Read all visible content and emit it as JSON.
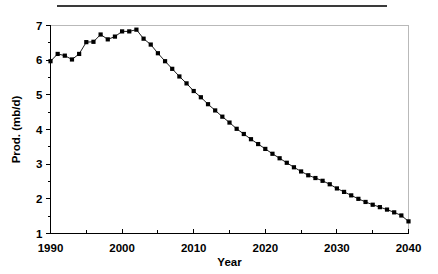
{
  "figure": {
    "top_rule_name": "scan-artifact-rule",
    "background": "#ffffff",
    "ink_color": "#000000",
    "frame_color": "#b9b9b9"
  },
  "chart_data": {
    "type": "line",
    "title": "",
    "xlabel": "Year",
    "ylabel": "Prod. (mb/d)",
    "xlim": [
      1990,
      2040
    ],
    "ylim": [
      1,
      7
    ],
    "xticks": [
      1990,
      2000,
      2010,
      2020,
      2030,
      2040
    ],
    "xtick_labels": [
      "1990",
      "2000",
      "2010",
      "2020",
      "2030",
      "2040"
    ],
    "xticks_minor": [
      1995,
      2005,
      2015,
      2025,
      2035
    ],
    "yticks": [
      1,
      2,
      3,
      4,
      5,
      6,
      7
    ],
    "ytick_labels": [
      "1",
      "2",
      "3",
      "4",
      "5",
      "6",
      "7"
    ],
    "yticks_minor": [
      1.5,
      2.5,
      3.5,
      4.5,
      5.5,
      6.5
    ],
    "grid": false,
    "legend": false,
    "marker": "square",
    "series": [
      {
        "name": "Production",
        "x": [
          1990,
          1991,
          1992,
          1993,
          1994,
          1995,
          1996,
          1997,
          1998,
          1999,
          2000,
          2001,
          2002,
          2003,
          2004,
          2005,
          2006,
          2007,
          2008,
          2009,
          2010,
          2011,
          2012,
          2013,
          2014,
          2015,
          2016,
          2017,
          2018,
          2019,
          2020,
          2021,
          2022,
          2023,
          2024,
          2025,
          2026,
          2027,
          2028,
          2029,
          2030,
          2031,
          2032,
          2033,
          2034,
          2035,
          2036,
          2037,
          2038,
          2039,
          2040
        ],
        "values": [
          5.97,
          6.18,
          6.13,
          6.02,
          6.18,
          6.52,
          6.53,
          6.74,
          6.6,
          6.68,
          6.83,
          6.83,
          6.88,
          6.62,
          6.45,
          6.2,
          5.97,
          5.75,
          5.53,
          5.33,
          5.11,
          4.93,
          4.73,
          4.55,
          4.37,
          4.2,
          4.02,
          3.87,
          3.72,
          3.58,
          3.44,
          3.3,
          3.17,
          3.04,
          2.91,
          2.79,
          2.68,
          2.6,
          2.52,
          2.42,
          2.3,
          2.2,
          2.1,
          2.0,
          1.91,
          1.83,
          1.76,
          1.69,
          1.61,
          1.52,
          1.35
        ]
      }
    ]
  },
  "axis_labels": {
    "x_title": "Year",
    "y_title": "Prod. (mb/d)"
  }
}
